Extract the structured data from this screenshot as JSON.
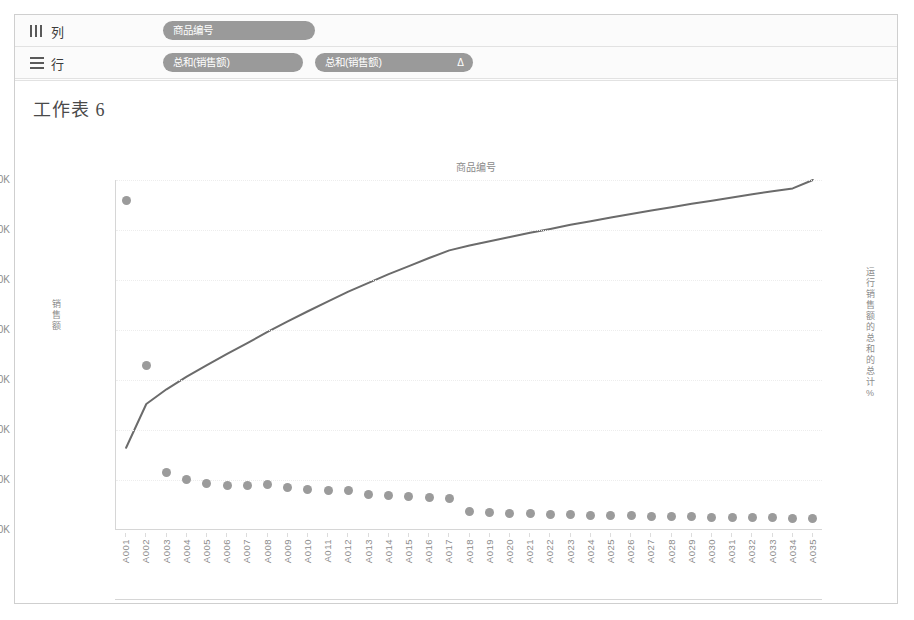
{
  "shelves": {
    "columns": {
      "label": "列",
      "icon": "columns-icon",
      "pills": [
        {
          "text": "商品编号"
        }
      ]
    },
    "rows": {
      "label": "行",
      "icon": "rows-icon",
      "pills": [
        {
          "text": "总和(销售额)"
        },
        {
          "text": "总和(销售额)",
          "badge": "Δ"
        }
      ]
    }
  },
  "worksheet": {
    "title": "工作表 6"
  },
  "chart_data": {
    "type": "bar",
    "title": "工作表 6",
    "xlabel": "商品编号",
    "ylabel": "销售额",
    "ylabel_right": "运行 销售额 的总和 的总计 %",
    "grid": true,
    "legend": "none",
    "categories": [
      "A001",
      "A002",
      "A003",
      "A004",
      "A005",
      "A006",
      "A007",
      "A008",
      "A009",
      "A010",
      "A011",
      "A012",
      "A013",
      "A014",
      "A015",
      "A016",
      "A017",
      "A018",
      "A019",
      "A020",
      "A021",
      "A022",
      "A023",
      "A024",
      "A025",
      "A026",
      "A027",
      "A028",
      "A029",
      "A030",
      "A031",
      "A032",
      "A033",
      "A034",
      "A035"
    ],
    "ylim": [
      0,
      70000
    ],
    "ytick_labels": [
      "70K",
      "60K",
      "50K",
      "40K",
      "30K",
      "20K",
      "10K",
      "0K"
    ],
    "ytick_values": [
      70000,
      60000,
      50000,
      40000,
      30000,
      20000,
      10000,
      0
    ],
    "ylim_right": [
      0,
      100
    ],
    "ytick_labels_right": [
      "100%",
      "80%",
      "60%",
      "40%",
      "20%",
      "0%"
    ],
    "ytick_values_right": [
      100,
      80,
      60,
      40,
      20,
      0
    ],
    "series": [
      {
        "name": "总和(销售额)",
        "mark": "circle",
        "axis": "left",
        "color": "#9b9b9b",
        "values": [
          66000,
          33000,
          11500,
          10200,
          9300,
          9000,
          8900,
          9100,
          8500,
          8200,
          7900,
          7900,
          7200,
          6900,
          6700,
          6600,
          6300,
          3800,
          3500,
          3400,
          3300,
          3200,
          3200,
          3000,
          2900,
          2900,
          2800,
          2700,
          2700,
          2600,
          2600,
          2500,
          2500,
          2400,
          2300
        ]
      },
      {
        "name": "运行 销售额 的总和 的总计 %",
        "mark": "line",
        "axis": "right",
        "color": "#6b6b6b",
        "values": [
          23.5,
          36.0,
          40.2,
          43.8,
          47.1,
          50.3,
          53.4,
          56.6,
          59.6,
          62.5,
          65.3,
          68.1,
          70.6,
          73.1,
          75.4,
          77.7,
          79.9,
          81.3,
          82.5,
          83.7,
          84.9,
          86.0,
          87.2,
          88.2,
          89.3,
          90.3,
          91.3,
          92.2,
          93.2,
          94.1,
          95.0,
          95.9,
          96.8,
          97.6,
          100.0
        ]
      }
    ]
  }
}
